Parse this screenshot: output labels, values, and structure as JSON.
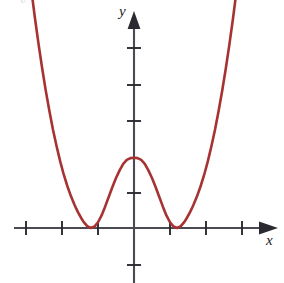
{
  "figure": {
    "name": "quartic-graph",
    "width": 284,
    "height": 283,
    "background_color": "#ffffff",
    "top_cutoff_text": "y"
  },
  "axes": {
    "x_label": "x",
    "y_label": "y",
    "axis_color": "#4a4a52",
    "tick_color": "#2a2a30",
    "origin_px": [
      134,
      228
    ],
    "unit_px": 36,
    "x_arrow": true,
    "y_arrow": true
  },
  "chart_data": {
    "type": "line",
    "title": "",
    "xlabel": "x",
    "ylabel": "y",
    "grid": false,
    "legend": false,
    "curve_color": "#a63232",
    "curve_width": 2.6,
    "xlim": [
      -3.2,
      3.2
    ],
    "ylim": [
      -1.2,
      5.6
    ],
    "xticks": [
      -3,
      -2,
      -1,
      1,
      2,
      3
    ],
    "yticks": [
      -1,
      1,
      2,
      3,
      4,
      5
    ],
    "xtick_labels": [
      "",
      "",
      "",
      "",
      "",
      ""
    ],
    "ytick_labels": [
      "",
      "",
      "",
      "",
      "",
      ""
    ],
    "annotations": [
      {
        "label": "local maximum",
        "x": 0,
        "y": 1.95
      },
      {
        "label": "root (touch point)",
        "x": -1.53,
        "y": 0
      },
      {
        "label": "root (touch point)",
        "x": 1.53,
        "y": 0
      }
    ],
    "series": [
      {
        "name": "f(x)",
        "x": [
          -2.95,
          -2.85,
          -2.75,
          -2.65,
          -2.55,
          -2.45,
          -2.35,
          -2.25,
          -2.15,
          -2.05,
          -1.95,
          -1.85,
          -1.75,
          -1.65,
          -1.6,
          -1.56,
          -1.53,
          -1.5,
          -1.45,
          -1.4,
          -1.3,
          -1.2,
          -1.1,
          -1.0,
          -0.9,
          -0.8,
          -0.7,
          -0.6,
          -0.5,
          -0.4,
          -0.3,
          -0.2,
          -0.1,
          0.0,
          0.1,
          0.2,
          0.3,
          0.4,
          0.5,
          0.6,
          0.7,
          0.8,
          0.9,
          1.0,
          1.1,
          1.2,
          1.3,
          1.4,
          1.45,
          1.5,
          1.53,
          1.56,
          1.6,
          1.65,
          1.75,
          1.85,
          1.95,
          2.05,
          2.15,
          2.25,
          2.35,
          2.45,
          2.55,
          2.65,
          2.75,
          2.85,
          2.95
        ],
        "y": [
          7.42,
          6.6,
          5.82,
          5.1,
          4.43,
          3.81,
          3.25,
          2.73,
          2.27,
          1.85,
          1.48,
          1.16,
          0.88,
          0.64,
          0.53,
          0.45,
          0.39,
          0.34,
          0.25,
          0.17,
          0.05,
          0.0,
          0.04,
          0.16,
          0.35,
          0.6,
          0.87,
          1.14,
          1.39,
          1.6,
          1.78,
          1.89,
          1.94,
          1.95,
          1.94,
          1.89,
          1.78,
          1.6,
          1.39,
          1.14,
          0.87,
          0.6,
          0.35,
          0.16,
          0.04,
          0.0,
          0.05,
          0.17,
          0.25,
          0.34,
          0.39,
          0.45,
          0.53,
          0.64,
          0.88,
          1.16,
          1.48,
          1.85,
          2.27,
          2.73,
          3.25,
          3.81,
          4.43,
          5.1,
          5.82,
          6.6,
          7.42
        ]
      }
    ]
  }
}
